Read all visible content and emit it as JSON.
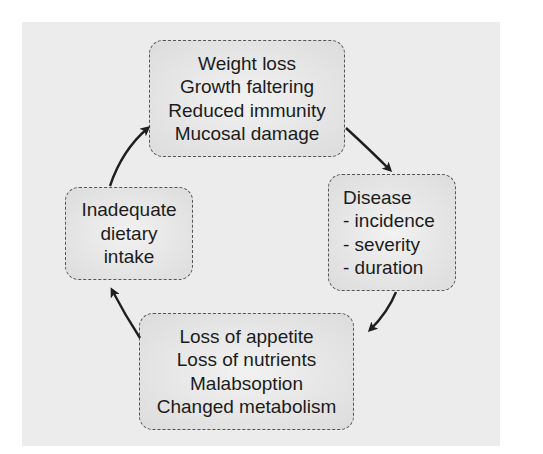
{
  "diagram": {
    "type": "cycle",
    "boxes": [
      {
        "id": "top",
        "lines": [
          "Weight loss",
          "Growth faltering",
          "Reduced immunity",
          "Mucosal damage"
        ]
      },
      {
        "id": "right",
        "lines": [
          "Disease",
          "- incidence",
          "- severity",
          "- duration"
        ]
      },
      {
        "id": "bottom",
        "lines": [
          "Loss of appetite",
          "Loss of nutrients",
          "Malabsoption",
          "Changed metabolism"
        ]
      },
      {
        "id": "left",
        "lines": [
          "Inadequate",
          "dietary",
          "intake"
        ]
      }
    ],
    "arrows": [
      {
        "from": "top",
        "to": "right"
      },
      {
        "from": "right",
        "to": "bottom"
      },
      {
        "from": "bottom",
        "to": "left"
      },
      {
        "from": "left",
        "to": "top"
      }
    ],
    "colors": {
      "panel_background": "#ececec",
      "box_fill": "#e4e4e4",
      "box_border": "#555555",
      "arrow": "#1f1f1f",
      "text": "#1c1c1c"
    }
  }
}
